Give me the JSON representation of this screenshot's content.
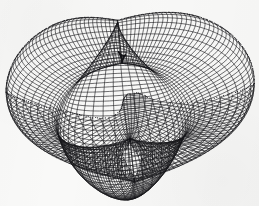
{
  "figure": {
    "title": "",
    "caption": "",
    "kind": "parametric-surface-wireframe",
    "background_color": "#f9f9f8",
    "line_color": "#16161a",
    "canvas": {
      "width": 259,
      "height": 206
    }
  },
  "chart_data": {
    "type": "line",
    "title": "",
    "subtitle": "",
    "xlabel": "",
    "ylabel": "",
    "grid": false,
    "legend": null,
    "legend_position": "none",
    "axes_visible": false,
    "tick_labels": {
      "x": [],
      "y": []
    },
    "annotations": [],
    "render": {
      "projection": "orthographic",
      "surface_family": "closed-blob-superquadric",
      "description": "Dense quadrilateral wireframe of a closed three-lobed blob surface with a central saddle crease; hidden lines removed so the near-left lobe occludes the far body.",
      "u_lines": 72,
      "v_lines": 72,
      "u_range": [
        0,
        6.283185307179586
      ],
      "v_range": [
        -1.5707963267948966,
        1.5707963267948966
      ],
      "shape_coeffs": {
        "radius_base": 1.0,
        "lobe_amplitude_u": 0.3,
        "lobe_count_u": 3,
        "lobe_amplitude_v": 0.16,
        "lobe_count_v": 2,
        "saddle_depth": 0.34,
        "squash_z": 0.8
      },
      "camera": {
        "azimuth_deg": 34,
        "elevation_deg": 22,
        "roll_deg": -6,
        "scale": 96,
        "center_px": [
          126,
          101
        ]
      },
      "stroke_width_px": 0.62,
      "silhouette_stroke_width_px": 1.15
    },
    "bounding_box_px": {
      "x_min": 12,
      "y_min": 15,
      "x_max": 241,
      "y_max": 188
    },
    "features": [
      {
        "name": "upper-left-lobe",
        "center_px": [
          72,
          60
        ]
      },
      {
        "name": "front-left-lobe",
        "center_px": [
          78,
          130
        ]
      },
      {
        "name": "right-lobe",
        "center_px": [
          180,
          100
        ]
      },
      {
        "name": "central-saddle-crease",
        "from_px": [
          97,
          76
        ],
        "to_px": [
          160,
          116
        ]
      },
      {
        "name": "right-side-notch",
        "center_px": [
          236,
          112
        ]
      },
      {
        "name": "top-dip",
        "center_px": [
          146,
          21
        ]
      }
    ]
  }
}
